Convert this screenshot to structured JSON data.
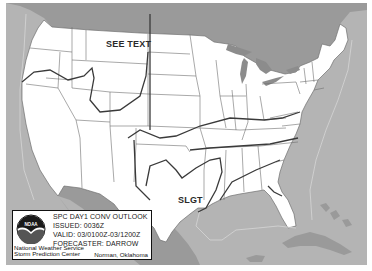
{
  "map": {
    "title": "SPC Day 1 Convective Outlook",
    "colors": {
      "ocean": "#b4b4b4",
      "land_us": "#ffffff",
      "land_foreign": "#9a9a9a",
      "great_lakes": "#8c8c8c",
      "state_borders": "#6e6e6e",
      "outlook_lines": "#3a3a3a",
      "marine_boundaries": "#d6d6d6"
    },
    "labels": [
      {
        "id": "see-text",
        "text": "SEE TEXT",
        "x": 100,
        "y": 36
      },
      {
        "id": "slgt",
        "text": "SLGT",
        "x": 178,
        "y": 199
      }
    ]
  },
  "legend": {
    "logo_text": "NOAA",
    "product": "SPC DAY1 CONV OUTLOOK",
    "issued": "ISSUED: 0036Z",
    "valid": "VALID: 03/0100Z-03/1200Z",
    "forecaster": "FORECASTER: DARROW",
    "agency_line1": "National Weather Service",
    "agency_line2": "Storm Prediction Center",
    "location": "Norman, Oklahoma"
  }
}
